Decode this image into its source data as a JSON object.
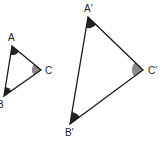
{
  "diagram": {
    "type": "similar-triangles",
    "colors": {
      "stroke": "#1a1a1a",
      "dark_angle": "#222222",
      "gray_angle": "#8a8a8a",
      "background": "#ffffff"
    },
    "small_triangle": {
      "vertices": {
        "A": [
          12,
          46
        ],
        "B": [
          4,
          96
        ],
        "C": [
          41,
          70
        ]
      },
      "labels": {
        "A": "A",
        "B": "B",
        "C": "C"
      }
    },
    "large_triangle": {
      "vertices": {
        "A": [
          88,
          17
        ],
        "B": [
          70,
          124
        ],
        "C": [
          143,
          70
        ]
      },
      "labels": {
        "A": "A′",
        "B": "B′",
        "C": "C′"
      }
    }
  }
}
